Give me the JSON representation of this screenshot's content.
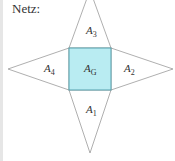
{
  "title": "Netz:",
  "colors": {
    "base_fill": "#b9ecf2",
    "base_stroke": "#4a9aa6",
    "triangle_stroke": "#9a9a9a",
    "text": "#333333"
  },
  "labels": {
    "base": {
      "main": "A",
      "sub": "G"
    },
    "front": {
      "main": "A",
      "sub": "1"
    },
    "right": {
      "main": "A",
      "sub": "2"
    },
    "back": {
      "main": "A",
      "sub": "3"
    },
    "left": {
      "main": "A",
      "sub": "4"
    }
  }
}
